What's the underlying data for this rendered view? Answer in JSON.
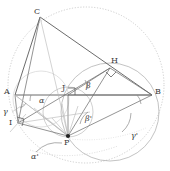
{
  "figure": {
    "kind": "geometry-diagram",
    "background": "#ffffff",
    "stroke_dark": "#4a4a4a",
    "stroke_mid": "#777777",
    "stroke_light": "#b9b9b9",
    "stroke_faint": "#cfcfcf",
    "width": 170,
    "height": 171
  },
  "vertices": [
    {
      "id": "C",
      "label": "C",
      "x": 40,
      "y": 17,
      "label_x": 34,
      "label_y": 8,
      "filled": false
    },
    {
      "id": "A",
      "label": "A",
      "x": 15,
      "y": 95,
      "label_x": 6,
      "label_y": 89,
      "filled": false
    },
    {
      "id": "B",
      "label": "B",
      "x": 152,
      "y": 95,
      "label_x": 155,
      "label_y": 89,
      "filled": false
    },
    {
      "id": "H",
      "label": "H",
      "x": 110,
      "y": 68,
      "label_x": 111,
      "label_y": 58,
      "filled": false
    },
    {
      "id": "J",
      "label": "J",
      "x": 68,
      "y": 95,
      "label_x": 63,
      "label_y": 85,
      "filled": false
    },
    {
      "id": "I",
      "label": "I",
      "x": 18,
      "y": 123,
      "label_x": 10,
      "label_y": 121,
      "filled": false
    },
    {
      "id": "P",
      "label": "P",
      "x": 68,
      "y": 136,
      "label_x": 65,
      "label_y": 140,
      "filled": true
    }
  ],
  "angles": [
    {
      "id": "alpha",
      "label": "α",
      "x": 40,
      "y": 98,
      "at": "A"
    },
    {
      "id": "alpha-prime",
      "label": "α'",
      "x": 33,
      "y": 155,
      "at": "P"
    },
    {
      "id": "beta",
      "label": "β",
      "x": 88,
      "y": 84,
      "at": "J"
    },
    {
      "id": "beta-prime",
      "label": "β'",
      "x": 87,
      "y": 117,
      "at": "P"
    },
    {
      "id": "gamma",
      "label": "γ",
      "x": 5,
      "y": 110,
      "at": "A"
    },
    {
      "id": "gamma-prime",
      "label": "γ'",
      "x": 133,
      "y": 134,
      "at": "B"
    }
  ],
  "right_angle_markers": [
    {
      "id": "right-angle-J",
      "at": "J"
    },
    {
      "id": "right-angle-I",
      "at": "I"
    },
    {
      "id": "right-angle-H",
      "at": "H"
    }
  ],
  "circles": [
    {
      "id": "circumcircle",
      "cx": 86,
      "cy": 85,
      "r": 78,
      "style": "dotted"
    },
    {
      "id": "circle-HBP",
      "cx": 110,
      "cy": 112,
      "r": 49,
      "style": "solid-light"
    },
    {
      "id": "circle-JP",
      "cx": 68,
      "cy": 112,
      "r": 25,
      "style": "solid-light"
    },
    {
      "id": "circle-small-A",
      "cx": 41,
      "cy": 99,
      "r": 28,
      "style": "solid-faint"
    }
  ]
}
